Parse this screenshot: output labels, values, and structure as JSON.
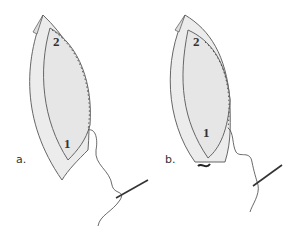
{
  "figure": {
    "panels": [
      {
        "id": "a",
        "label": "a.",
        "fold_numbers": [
          "2",
          "1"
        ]
      },
      {
        "id": "b",
        "label": "b.",
        "fold_numbers": [
          "2",
          "1"
        ]
      }
    ],
    "colors": {
      "fabric_fill": "#ececec",
      "outline": "#555555",
      "thread": "#444444"
    }
  }
}
